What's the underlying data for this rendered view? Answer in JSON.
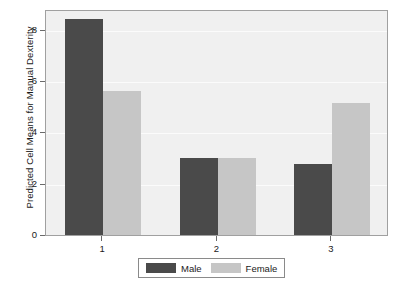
{
  "chart_data": {
    "type": "bar",
    "title": "",
    "subtitle": "",
    "xlabel": "",
    "ylabel": "Predicted Cell Means for Manual Dexterity",
    "categories": [
      "1",
      "2",
      "3"
    ],
    "series": [
      {
        "name": "Male",
        "color": "#4a4a4a",
        "values": [
          8.4,
          3.0,
          2.75
        ]
      },
      {
        "name": "Female",
        "color": "#c6c6c6",
        "values": [
          5.6,
          3.0,
          5.15
        ]
      }
    ],
    "ylim": [
      0,
      8.8
    ],
    "yticks": [
      "0",
      "2",
      "4",
      "6",
      "8"
    ],
    "ytick_values": [
      0,
      2,
      4,
      6,
      8
    ],
    "xticks": [
      "1",
      "2",
      "3"
    ],
    "grid": true,
    "legend_position": "bottom",
    "plot_background": "#f0f0f0",
    "frame_color": "#a0a0a0"
  },
  "legend": {
    "items": [
      {
        "label": "Male"
      },
      {
        "label": "Female"
      }
    ]
  }
}
